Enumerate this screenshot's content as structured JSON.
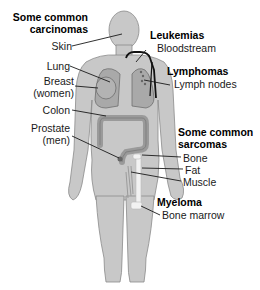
{
  "diagram": {
    "groups": [
      {
        "title": "Some common carcinomas",
        "title_lines": [
          "Some common",
          "carcinomas"
        ],
        "items": [
          "Skin",
          "Lung",
          "Breast (women)",
          "Colon",
          "Prostate (men)"
        ],
        "item_lines": {
          "skin": "Skin",
          "lung": "Lung",
          "breast_1": "Breast",
          "breast_2": "(women)",
          "colon": "Colon",
          "prostate_1": "Prostate",
          "prostate_2": "(men)"
        }
      },
      {
        "title": "Leukemias",
        "items": [
          "Bloodstream"
        ]
      },
      {
        "title": "Lymphomas",
        "items": [
          "Lymph nodes"
        ]
      },
      {
        "title": "Some common sarcomas",
        "title_lines": [
          "Some common",
          "sarcomas"
        ],
        "items": [
          "Bone",
          "Fat",
          "Muscle"
        ]
      },
      {
        "title": "Myeloma",
        "items": [
          "Bone marrow"
        ]
      }
    ],
    "figure": "human-body-silhouette",
    "colors": {
      "body_fill": "#c8c8c8",
      "body_stroke": "#8a8a8a",
      "organ_fill": "#a9a9a9",
      "organ_stroke": "#6e6e6e",
      "vessel": "#111111",
      "leader": "#1a1a1a",
      "bone": "#f2f2f2"
    }
  }
}
